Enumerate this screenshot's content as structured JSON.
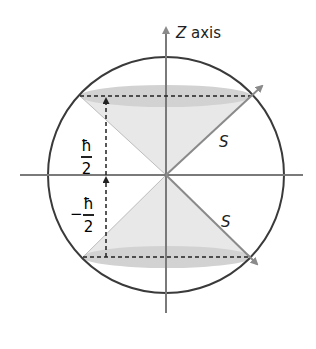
{
  "diagram": {
    "axis_label_var": "Z",
    "axis_label_text": " axis",
    "vector_label_upper": "S",
    "vector_label_lower": "S",
    "upper_projection": {
      "numerator": "ħ",
      "denominator": "2",
      "sign": ""
    },
    "lower_projection": {
      "numerator": "ħ",
      "denominator": "2",
      "sign": "−"
    },
    "colors": {
      "circle": "#3a3a3a",
      "axes": "#7a7a7a",
      "cone_fill": "#e6e6e6",
      "ellipse_fill": "#cfcfcf",
      "dashed": "#222222",
      "vector": "#8a8a8a"
    }
  }
}
